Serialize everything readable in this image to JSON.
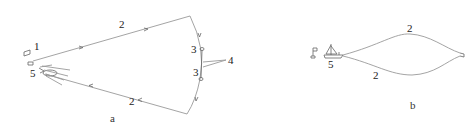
{
  "figure": {
    "panels": [
      {
        "id": "a",
        "caption": "a",
        "labels": {
          "marker_1": "1",
          "line_top": "2",
          "line_bottom": "2",
          "node_upper": "3",
          "node_lower": "3",
          "pointer": "4",
          "vessel": "5"
        }
      },
      {
        "id": "b",
        "caption": "b",
        "labels": {
          "line_top": "2",
          "line_bottom": "2",
          "vessel": "5"
        }
      }
    ],
    "colors": {
      "line": "#9a9a9a",
      "text": "#222222"
    }
  }
}
